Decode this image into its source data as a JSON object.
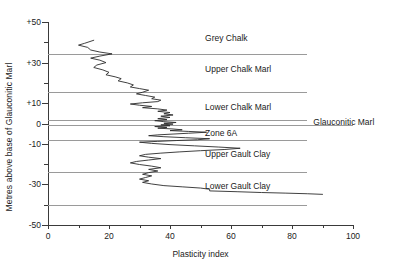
{
  "chart_data": {
    "type": "line",
    "title": "",
    "xlabel": "Plasticity index",
    "ylabel": "Metres above base of Glauconitic Marl",
    "xlim": [
      0,
      100
    ],
    "ylim": [
      -50,
      50
    ],
    "grid": false,
    "legend": "none",
    "orientation": "vertical-profile",
    "x_ticks": [
      0,
      20,
      40,
      60,
      80,
      100
    ],
    "x_tick_labels": [
      "0",
      "20",
      "40",
      "60",
      "80",
      "100"
    ],
    "x_minor_ticks": [
      10,
      30,
      50,
      70,
      90
    ],
    "y_ticks": [
      50,
      30,
      10,
      0,
      -10,
      -30,
      -50
    ],
    "y_tick_labels": [
      "+50",
      "+30",
      "+10",
      "0",
      "-10",
      "-30",
      "-50"
    ],
    "y_minor_ticks": [
      40,
      20,
      -20,
      -40
    ],
    "series": [
      {
        "name": "Plasticity index profile",
        "color": "#2b2b2b",
        "points": [
          [
            15,
            41.0
          ],
          [
            12,
            39.5
          ],
          [
            10,
            38.6
          ],
          [
            13,
            37.5
          ],
          [
            14,
            36.2
          ],
          [
            17,
            35.2
          ],
          [
            21,
            34.3
          ],
          [
            17,
            33.2
          ],
          [
            14,
            32.2
          ],
          [
            17,
            31.2
          ],
          [
            19,
            30.0
          ],
          [
            16,
            28.8
          ],
          [
            15,
            27.6
          ],
          [
            18,
            26.4
          ],
          [
            20,
            25.2
          ],
          [
            19,
            24.0
          ],
          [
            22,
            23.0
          ],
          [
            24,
            22.1
          ],
          [
            23,
            21.0
          ],
          [
            26,
            20.0
          ],
          [
            28,
            19.0
          ],
          [
            27,
            18.0
          ],
          [
            30,
            17.2
          ],
          [
            33,
            16.4
          ],
          [
            31,
            15.4
          ],
          [
            29,
            14.6
          ],
          [
            32,
            13.8
          ],
          [
            35,
            13.0
          ],
          [
            34,
            12.2
          ],
          [
            37,
            11.5
          ],
          [
            36,
            10.8
          ],
          [
            31,
            10.2
          ],
          [
            27,
            9.6
          ],
          [
            30,
            9.0
          ],
          [
            34,
            8.4
          ],
          [
            31,
            7.8
          ],
          [
            36,
            7.2
          ],
          [
            39,
            6.6
          ],
          [
            36,
            6.0
          ],
          [
            40,
            5.4
          ],
          [
            38,
            4.8
          ],
          [
            41,
            4.2
          ],
          [
            37,
            3.6
          ],
          [
            40,
            3.0
          ],
          [
            36,
            2.4
          ],
          [
            39,
            1.9
          ],
          [
            35,
            1.4
          ],
          [
            38,
            0.9
          ],
          [
            42,
            0.5
          ],
          [
            38,
            0.1
          ],
          [
            41,
            -0.3
          ],
          [
            37,
            -0.7
          ],
          [
            40,
            -1.1
          ],
          [
            35,
            -1.5
          ],
          [
            39,
            -1.9
          ],
          [
            36,
            -2.3
          ],
          [
            41,
            -2.7
          ],
          [
            44,
            -3.1
          ],
          [
            40,
            -3.5
          ],
          [
            46,
            -3.9
          ],
          [
            52,
            -4.3
          ],
          [
            46,
            -4.8
          ],
          [
            41,
            -5.2
          ],
          [
            36,
            -5.6
          ],
          [
            33,
            -6.0
          ],
          [
            38,
            -6.5
          ],
          [
            45,
            -7.0
          ],
          [
            53,
            -7.5
          ],
          [
            49,
            -8.0
          ],
          [
            42,
            -8.4
          ],
          [
            36,
            -8.8
          ],
          [
            30,
            -9.2
          ],
          [
            34,
            -9.8
          ],
          [
            40,
            -10.4
          ],
          [
            48,
            -11.0
          ],
          [
            56,
            -11.6
          ],
          [
            63,
            -12.2
          ],
          [
            58,
            -12.8
          ],
          [
            50,
            -13.4
          ],
          [
            43,
            -14.0
          ],
          [
            37,
            -14.6
          ],
          [
            32,
            -15.2
          ],
          [
            30,
            -15.9
          ],
          [
            33,
            -16.6
          ],
          [
            37,
            -17.3
          ],
          [
            33,
            -18.0
          ],
          [
            29,
            -18.7
          ],
          [
            27,
            -19.4
          ],
          [
            30,
            -20.2
          ],
          [
            34,
            -21.0
          ],
          [
            37,
            -21.8
          ],
          [
            33,
            -22.6
          ],
          [
            36,
            -23.4
          ],
          [
            33,
            -24.2
          ],
          [
            31,
            -25.0
          ],
          [
            34,
            -25.8
          ],
          [
            32,
            -26.6
          ],
          [
            30,
            -27.4
          ],
          [
            33,
            -28.2
          ],
          [
            31,
            -29.0
          ],
          [
            34,
            -29.8
          ],
          [
            38,
            -30.6
          ],
          [
            44,
            -31.2
          ],
          [
            50,
            -31.8
          ],
          [
            53,
            -32.4
          ],
          [
            53,
            -33.2
          ],
          [
            62,
            -33.6
          ],
          [
            70,
            -34.0
          ],
          [
            78,
            -34.3
          ],
          [
            85,
            -34.6
          ],
          [
            90,
            -34.9
          ]
        ]
      }
    ],
    "strata": [
      {
        "name": "Grey Chalk",
        "label": "Grey Chalk",
        "label_y": 42,
        "boundary_bottom": 34,
        "line_right": 0.85
      },
      {
        "name": "Upper Chalk Marl",
        "label": "Upper Chalk Marl",
        "label_y": 27,
        "boundary_bottom": 15.5,
        "line_right": 0.85
      },
      {
        "name": "Lower Chalk Marl",
        "label": "Lower Chalk Marl",
        "label_y": 8,
        "boundary_bottom": 1.8,
        "line_right": 0.85
      },
      {
        "name": "Glauconitic Marl",
        "label": "Glauconitic Marl",
        "label_y": 0.6,
        "boundary_bottom": -0.6,
        "line_right": 1.0
      },
      {
        "name": "Zone 6A",
        "label": "Zone 6A",
        "label_y": -4.5,
        "boundary_bottom": -8.0,
        "line_right": 0.85
      },
      {
        "name": "Upper Gault Clay",
        "label": "Upper Gault Clay",
        "label_y": -15,
        "boundary_bottom": -24,
        "line_right": 0.85
      },
      {
        "name": "Lower Gault Clay",
        "label": "Lower Gault Clay",
        "label_y": -31,
        "boundary_bottom": -40,
        "line_right": 0.85
      }
    ]
  },
  "colors": {
    "axis": "#3a3a3a",
    "strat_line": "#9a9a9a",
    "curve": "#2b2b2b",
    "text": "#1a1a1a",
    "background": "#ffffff"
  }
}
